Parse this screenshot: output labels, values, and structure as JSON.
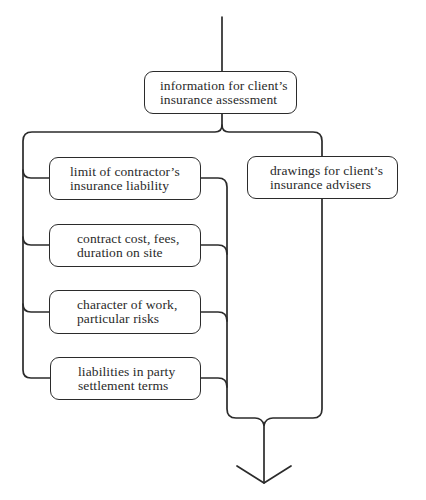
{
  "diagram": {
    "type": "flow",
    "top_node": {
      "line1": "information for client’s",
      "line2": "insurance assessment"
    },
    "left_branch": [
      {
        "line1": "limit of contractor’s",
        "line2": "insurance liability"
      },
      {
        "line1": "contract cost, fees,",
        "line2": "duration on site"
      },
      {
        "line1": "character of work,",
        "line2": "particular risks"
      },
      {
        "line1": "liabilities in party",
        "line2": "settlement terms"
      }
    ],
    "right_branch": [
      {
        "line1": "drawings for client’s",
        "line2": "insurance advisers"
      }
    ],
    "flow_in": "arrow-in-from-top",
    "flow_out": "arrow-down-to-bottom",
    "line_color": "#2b2b2b",
    "background_color": "#ffffff"
  }
}
